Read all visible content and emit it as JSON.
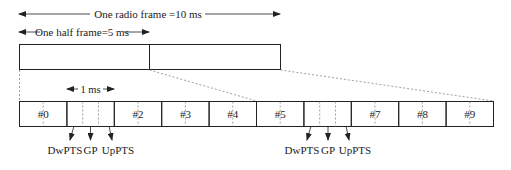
{
  "diagram": {
    "radio_frame_label": "One radio frame =10 ms",
    "half_frame_label": "One half frame=5 ms",
    "subframe_duration_label": "1 ms",
    "subframes": [
      {
        "label": "#0",
        "special": false
      },
      {
        "label": "",
        "special": true
      },
      {
        "label": "#2",
        "special": false
      },
      {
        "label": "#3",
        "special": false
      },
      {
        "label": "#4",
        "special": false
      },
      {
        "label": "#5",
        "special": false
      },
      {
        "label": "",
        "special": true
      },
      {
        "label": "#7",
        "special": false
      },
      {
        "label": "#8",
        "special": false
      },
      {
        "label": "#9",
        "special": false
      }
    ],
    "special_fields": [
      "DwPTS",
      "GP",
      "UpPTS"
    ],
    "special_1": {
      "dwpts": "DwPTS",
      "gp": "GP",
      "uppts": "UpPTS"
    },
    "special_2": {
      "dwpts": "DwPTS",
      "gp": "GP",
      "uppts": "UpPTS"
    },
    "colors": {
      "line": "#222222",
      "dashed": "#888888",
      "background": "#ffffff"
    }
  }
}
